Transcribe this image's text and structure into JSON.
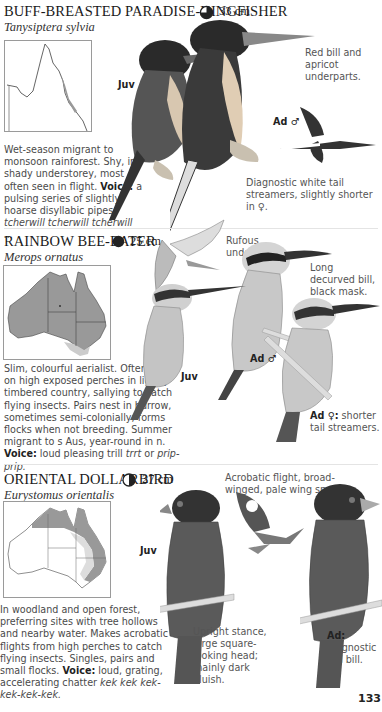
{
  "page_number": "133",
  "species": [
    {
      "common_name": "BUFF-BREASTED PARADISE-KINGFISHER",
      "scientific_name": "Tanysiptera sylvia",
      "status_icon": "three-quarter-circle-icon",
      "size": "33 cm",
      "description": "Wet-season migrant to monsoon rainforest. Shy, in shady understorey, most often seen in flight.",
      "voice_label": "Voice:",
      "voice_text": " a pulsing series of slightly hoarse disyllabic pipes: ",
      "voice_call": "tcherwill tcherwill tcherwill ...",
      "annotations": {
        "juv": "Juv",
        "ad_male": "Ad ♂",
        "bill": "Red bill and apricot underparts.",
        "tail": "Diagnostic white tail streamers, slightly shorter in ♀."
      }
    },
    {
      "common_name": "RAINBOW BEE-EATER",
      "scientific_name": "Merops ornatus",
      "status_icon": "full-circle-icon",
      "size": "25 cm",
      "description": "Slim, colourful aerialist. Often seen on high exposed perches in lightly timbered country, sallying to catch flying insects. Pairs nest in burrow, sometimes semi-colonially; forms flocks when not breeding. Summer migrant to s Aus, year-round in n.",
      "voice_label": "Voice:",
      "voice_text": " loud pleasing trill ",
      "voice_call_1": "trrt",
      "voice_or": " or ",
      "voice_call_2": "prip-prip.",
      "annotations": {
        "underwing": "Rufous underwing.",
        "bill": "Long decurved bill, black mask.",
        "juv": "Juv",
        "ad_male": "Ad ♂",
        "ad_female_tag": "Ad ♀:",
        "ad_female": " shorter tail streamers."
      }
    },
    {
      "common_name": "ORIENTAL DOLLARBIRD",
      "scientific_name": "Eurystomus orientalis",
      "status_icon": "half-circle-icon",
      "size": "27 cm",
      "description": "In woodland and open forest, preferring sites with tree hollows and nearby water. Makes acrobatic flights from high perches to catch flying insects. Singles, pairs and small flocks.",
      "voice_label": "Voice:",
      "voice_text": " loud, grating, accelerating chatter ",
      "voice_call": "kek kek kek-kek-kek-kek.",
      "annotations": {
        "flight": "Acrobatic flight, broad-winged, pale wing spots.",
        "juv": "Juv",
        "stance": "Upright stance, large square-looking head; mainly dark bluish.",
        "ad_tag": "Ad:",
        "ad": "diagnostic red bill."
      }
    }
  ]
}
